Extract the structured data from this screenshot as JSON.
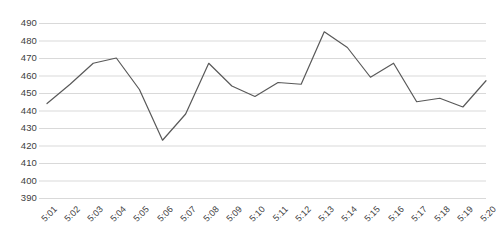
{
  "chart_data": {
    "type": "line",
    "title": "",
    "subtitle": "",
    "xlabel": "",
    "ylabel": "",
    "categories": [
      "5:01",
      "5:02",
      "5:03",
      "5:04",
      "5:05",
      "5:06",
      "5:07",
      "5:08",
      "5:09",
      "5:10",
      "5:11",
      "5:12",
      "5:13",
      "5:14",
      "5:15",
      "5:16",
      "5:17",
      "5:18",
      "5:19",
      "5:20"
    ],
    "values": [
      444,
      455,
      467,
      470,
      452,
      423,
      438,
      467,
      454,
      448,
      456,
      455,
      485,
      476,
      459,
      467,
      445,
      447,
      442,
      457
    ],
    "series": [
      {
        "name": "Series 1",
        "values": [
          444,
          455,
          467,
          470,
          452,
          423,
          438,
          467,
          454,
          448,
          456,
          455,
          485,
          476,
          459,
          467,
          445,
          447,
          442,
          457
        ],
        "color": "#595959"
      }
    ],
    "ylim": [
      390,
      490
    ],
    "ytick_step": 10,
    "yticks": [
      490,
      480,
      470,
      460,
      450,
      440,
      430,
      420,
      410,
      400,
      390
    ],
    "ytick_labels": [
      "490",
      "480",
      "470",
      "460",
      "450",
      "440",
      "430",
      "420",
      "410",
      "400",
      "390"
    ],
    "xticks": [
      "5:01",
      "5:02",
      "5:03",
      "5:04",
      "5:05",
      "5:06",
      "5:07",
      "5:08",
      "5:09",
      "5:10",
      "5:11",
      "5:12",
      "5:13",
      "5:14",
      "5:15",
      "5:16",
      "5:17",
      "5:18",
      "5:19",
      "5:20"
    ],
    "grid": true,
    "grid_axis": "y",
    "grid_color": "#d9d9d9",
    "legend": false,
    "legend_position": "none",
    "markers": false,
    "line_width": 1.2,
    "axis_line": false,
    "annotations": [],
    "background_color": "#ffffff",
    "text_color": "#404040"
  }
}
